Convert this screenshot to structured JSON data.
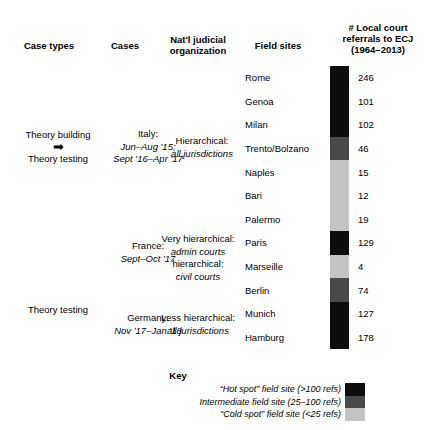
{
  "table": {
    "headers": {
      "case_types": "Case types",
      "cases": "Cases",
      "judicial_organization": "Nat'l judicial organization",
      "judicial_organization_line1": "Nat'l judicial",
      "judicial_organization_line2": "organization",
      "field_sites": "Field sites",
      "referrals_line1": "# Local court",
      "referrals_line2": "referrals to ECJ",
      "referrals_line3": "(1964–2013)"
    },
    "groups": [
      {
        "case_type_line1": "Theory building",
        "case_type_arrow": "➡",
        "case_type_line2": "Theory testing",
        "case_country": "Italy:",
        "case_dates_line1": "Jun–Aug '15;",
        "case_dates_line2": "Sept '16–Apr '17",
        "org_line1": "Hierarchical:",
        "org_line2": "all jurisdictions"
      },
      {
        "case_type_line1": "",
        "case_country": "France:",
        "case_dates_line1": "Sept–Oct '17",
        "org_line1": "Very hierarchical:",
        "org_line2": "admin courts",
        "org_line3": "hierarchical:",
        "org_line4": "civil courts"
      },
      {
        "case_type_line1": "Theory testing",
        "case_country": "Germany:",
        "case_dates_line1": "Nov '17–Jan '18",
        "org_line1": "Less hierarchical:",
        "org_line2": "all jurisdictions"
      }
    ],
    "field_sites": [
      {
        "name": "Rome",
        "referrals": "246",
        "color": "#0d0d0d"
      },
      {
        "name": "Genoa",
        "referrals": "101",
        "color": "#0d0d0d"
      },
      {
        "name": "Milan",
        "referrals": "102",
        "color": "#0d0d0d"
      },
      {
        "name": "Trento/Bolzano",
        "referrals": "46",
        "color": "#494949"
      },
      {
        "name": "Naples",
        "referrals": "15",
        "color": "#c4c4c4"
      },
      {
        "name": "Bari",
        "referrals": "12",
        "color": "#c4c4c4"
      },
      {
        "name": "Palermo",
        "referrals": "19",
        "color": "#c4c4c4"
      },
      {
        "name": "Paris",
        "referrals": "129",
        "color": "#0d0d0d"
      },
      {
        "name": "Marseille",
        "referrals": "4",
        "color": "#c4c4c4"
      },
      {
        "name": "Berlin",
        "referrals": "74",
        "color": "#494949"
      },
      {
        "name": "Munich",
        "referrals": "127",
        "color": "#0d0d0d"
      },
      {
        "name": "Hamburg",
        "referrals": "178",
        "color": "#0d0d0d"
      }
    ]
  },
  "key": {
    "title": "Key",
    "entries": [
      {
        "label": "“Hot spot” field site (>100 refs)",
        "color": "#0d0d0d"
      },
      {
        "label": "Intermediate field site (25–100 refs)",
        "color": "#494949"
      },
      {
        "label": "“Cold spot” field site (<25 refs)",
        "color": "#c4c4c4"
      }
    ]
  },
  "colors": {
    "hot": "#0d0d0d",
    "intermediate": "#494949",
    "cold": "#c4c4c4",
    "background": "#ffffff",
    "text": "#000000"
  },
  "chart_data": {
    "type": "table",
    "categories": [
      "Rome",
      "Genoa",
      "Milan",
      "Trento/Bolzano",
      "Naples",
      "Bari",
      "Palermo",
      "Paris",
      "Marseille",
      "Berlin",
      "Munich",
      "Hamburg"
    ],
    "values": [
      246,
      101,
      102,
      46,
      15,
      12,
      19,
      129,
      4,
      74,
      127,
      178
    ],
    "xlabel": "Field sites",
    "ylabel": "# Local court referrals to ECJ (1964–2013)",
    "legend": [
      "“Hot spot” field site (>100 refs)",
      "Intermediate field site (25–100 refs)",
      "“Cold spot” field site (<25 refs)"
    ],
    "legend_position": "bottom",
    "grid": false
  }
}
